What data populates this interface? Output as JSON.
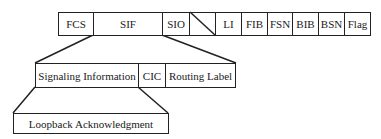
{
  "diagram": {
    "top_row": {
      "fields": [
        {
          "id": "fcs",
          "label": "FCS",
          "x": 58,
          "w": 36
        },
        {
          "id": "sif",
          "label": "SIF",
          "x": 93,
          "w": 70
        },
        {
          "id": "sio",
          "label": "SIO",
          "x": 162,
          "w": 28
        },
        {
          "id": "spare",
          "label": "",
          "x": 189,
          "w": 27
        },
        {
          "id": "li",
          "label": "LI",
          "x": 215,
          "w": 27
        },
        {
          "id": "fib",
          "label": "FIB",
          "x": 241,
          "w": 27
        },
        {
          "id": "fsn",
          "label": "FSN",
          "x": 267,
          "w": 26
        },
        {
          "id": "bib",
          "label": "BIB",
          "x": 292,
          "w": 27
        },
        {
          "id": "bsn",
          "label": "BSN",
          "x": 318,
          "w": 27
        },
        {
          "id": "flag",
          "label": "Flag",
          "x": 344,
          "w": 27
        }
      ]
    },
    "middle_row": {
      "fields": [
        {
          "id": "signaling-information",
          "label": "Signaling Information"
        },
        {
          "id": "cic",
          "label": "CIC"
        },
        {
          "id": "routing-label",
          "label": "Routing Label"
        }
      ]
    },
    "bottom_row": {
      "fields": [
        {
          "id": "loopback-acknowledgment",
          "label": "Loopback Acknowledgment"
        }
      ]
    },
    "colors": {
      "stroke": "#222222",
      "background": "#ffffff"
    }
  }
}
